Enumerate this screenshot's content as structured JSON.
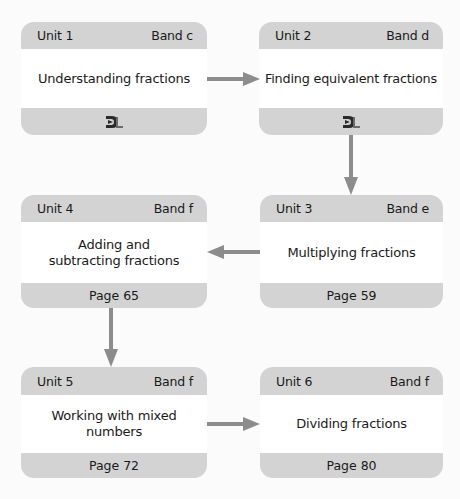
{
  "diagram": {
    "type": "flowchart",
    "colors": {
      "background": "#fbfbfb",
      "card_frame": "#d3d3d3",
      "card_body": "#ffffff",
      "arrow": "#8c8c8c",
      "text": "#1a1a1a"
    },
    "units": [
      {
        "unit": "Unit 1",
        "band": "Band c",
        "title": "Understanding fractions",
        "footer": "",
        "footer_icon": "dl-logo-icon"
      },
      {
        "unit": "Unit 2",
        "band": "Band d",
        "title": "Finding equivalent fractions",
        "footer": "",
        "footer_icon": "dl-logo-icon"
      },
      {
        "unit": "Unit 3",
        "band": "Band e",
        "title": "Multiplying fractions",
        "footer": "Page 59"
      },
      {
        "unit": "Unit 4",
        "band": "Band f",
        "title": "Adding and subtracting fractions",
        "footer": "Page 65"
      },
      {
        "unit": "Unit 5",
        "band": "Band f",
        "title": "Working with mixed numbers",
        "footer": "Page 72"
      },
      {
        "unit": "Unit 6",
        "band": "Band f",
        "title": "Dividing fractions",
        "footer": "Page 80"
      }
    ],
    "edges": [
      {
        "from": "Unit 1",
        "to": "Unit 2",
        "direction": "right"
      },
      {
        "from": "Unit 2",
        "to": "Unit 3",
        "direction": "down"
      },
      {
        "from": "Unit 3",
        "to": "Unit 4",
        "direction": "left"
      },
      {
        "from": "Unit 4",
        "to": "Unit 5",
        "direction": "down"
      },
      {
        "from": "Unit 5",
        "to": "Unit 6",
        "direction": "right"
      }
    ]
  }
}
